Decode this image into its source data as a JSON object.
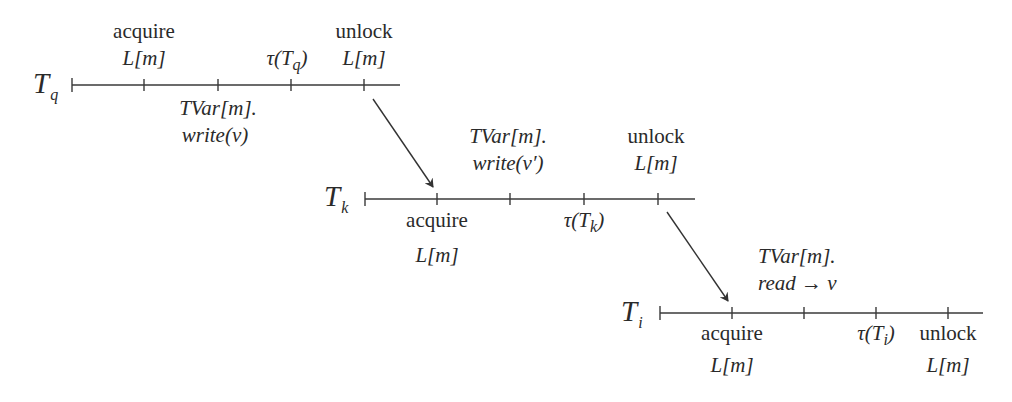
{
  "colors": {
    "ink": "#2a2a2a",
    "background": "#ffffff"
  },
  "threads": [
    {
      "id": "Tq",
      "label": "T",
      "subscript": "q",
      "events_above": [
        {
          "line1": "acquire",
          "line2": "L[m]"
        },
        {
          "line1": "",
          "line2": "τ(T",
          "line2_sub": "q",
          "line2_end": ")"
        },
        {
          "line1": "unlock",
          "line2": "L[m]"
        }
      ],
      "events_below": [
        {
          "line1": "TVar[m].",
          "line2": "write(v)"
        }
      ]
    },
    {
      "id": "Tk",
      "label": "T",
      "subscript": "k",
      "events_above": [
        {
          "line1": "TVar[m].",
          "line2": "write(v′)"
        },
        {
          "line1": "unlock",
          "line2": "L[m]"
        }
      ],
      "events_below": [
        {
          "line1": "acquire",
          "line2": "L[m]"
        },
        {
          "line1": "τ(T",
          "line1_sub": "k",
          "line1_end": ")"
        }
      ]
    },
    {
      "id": "Ti",
      "label": "T",
      "subscript": "i",
      "events_above": [
        {
          "line1": "TVar[m].",
          "line2": "read → v"
        }
      ],
      "events_below": [
        {
          "line1": "acquire",
          "line2": "L[m]"
        },
        {
          "line1": "τ(T",
          "line1_sub": "i",
          "line1_end": ")"
        },
        {
          "line1": "unlock",
          "line2": "L[m]"
        }
      ]
    }
  ],
  "arrows": [
    {
      "from": "Tq.unlock",
      "to": "Tk.acquire"
    },
    {
      "from": "Tk.unlock",
      "to": "Ti.acquire"
    }
  ]
}
